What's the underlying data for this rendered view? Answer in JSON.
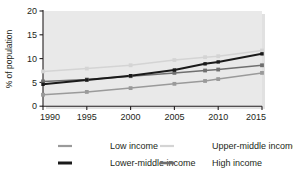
{
  "chart_data": {
    "type": "line",
    "title": "",
    "subtitle": "",
    "xlabel": "",
    "ylabel": "% of population",
    "xlim": [
      1990,
      2015
    ],
    "ylim": [
      0,
      20
    ],
    "grid": false,
    "legend_position": "bottom",
    "x_ticks": [
      "1990",
      "1995",
      "2000",
      "2005",
      "2010",
      "2015"
    ],
    "x_tick_values": [
      1990,
      1995,
      2000,
      2005,
      2010,
      2015
    ],
    "y_ticks": [
      "0",
      "5",
      "10",
      "15",
      "20"
    ],
    "y_tick_values": [
      0,
      5,
      10,
      15,
      20
    ],
    "x": [
      1990,
      1995,
      2000,
      2005,
      2008.5,
      2010,
      2015
    ],
    "marker": "square",
    "series": [
      {
        "name": "Low income",
        "color": "#9a9a9a",
        "values": [
          2.4,
          3.0,
          3.8,
          4.7,
          5.3,
          5.7,
          7.0
        ]
      },
      {
        "name": "Upper-middle income",
        "color": "#d4d4d4",
        "values": [
          7.3,
          7.9,
          8.6,
          9.7,
          10.3,
          10.5,
          11.7
        ]
      },
      {
        "name": "Lower-middle income",
        "color": "#1a1a1a",
        "values": [
          4.6,
          5.5,
          6.4,
          7.6,
          8.9,
          9.3,
          11.0
        ]
      },
      {
        "name": "High income",
        "color": "#6f6f6f",
        "values": [
          5.2,
          5.6,
          6.3,
          7.0,
          7.5,
          7.7,
          8.6
        ]
      }
    ]
  },
  "legend": {
    "items": [
      {
        "label": "Low income",
        "color": "#9a9a9a",
        "width": 2.2
      },
      {
        "label": "Upper-middle income",
        "color": "#d4d4d4",
        "width": 2.2
      },
      {
        "label": "Lower-middle income",
        "color": "#1a1a1a",
        "width": 3.0
      },
      {
        "label": "High income",
        "color": "#6f6f6f",
        "width": 2.6
      }
    ]
  },
  "style": {
    "plot_background": "#e9e9e9",
    "axis_color": "#231f20",
    "page_background": "#ffffff"
  }
}
